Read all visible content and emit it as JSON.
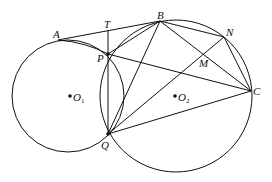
{
  "diagram": {
    "points": {
      "A": {
        "label": "A"
      },
      "T": {
        "label": "T"
      },
      "B": {
        "label": "B"
      },
      "N": {
        "label": "N"
      },
      "P": {
        "label": "P"
      },
      "M": {
        "label": "M"
      },
      "C": {
        "label": "C"
      },
      "Q": {
        "label": "Q"
      }
    },
    "centers": {
      "O1": {
        "label": "O",
        "sub": "1"
      },
      "O2": {
        "label": "O",
        "sub": "2"
      }
    },
    "segments": [
      [
        "A",
        "B"
      ],
      [
        "A",
        "P"
      ],
      [
        "T",
        "Q"
      ],
      [
        "P",
        "B"
      ],
      [
        "P",
        "C"
      ],
      [
        "Q",
        "B"
      ],
      [
        "Q",
        "N"
      ],
      [
        "Q",
        "C"
      ],
      [
        "B",
        "N"
      ],
      [
        "B",
        "C"
      ],
      [
        "N",
        "C"
      ]
    ],
    "circles": [
      "O1",
      "O2"
    ]
  }
}
